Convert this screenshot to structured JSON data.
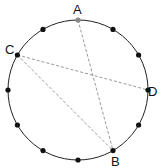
{
  "diagram": {
    "type": "circle-with-chords",
    "points_on_circle": 12,
    "labels": {
      "A": "A",
      "B": "B",
      "C": "C",
      "D": "D"
    },
    "chords": [
      {
        "from": "A",
        "to": "B",
        "style": "dashed"
      },
      {
        "from": "C",
        "to": "D",
        "style": "dashed"
      },
      {
        "from": "C",
        "to": "B",
        "style": "dashed"
      }
    ],
    "colors": {
      "circle": "#222222",
      "points": "#111111",
      "point_A": "#888888",
      "chords": "#999999"
    }
  }
}
